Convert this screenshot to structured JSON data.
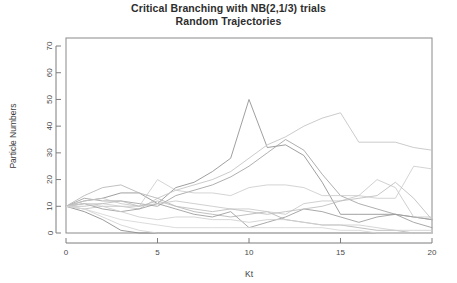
{
  "figure": {
    "width": 457,
    "height": 283,
    "background": "#ffffff"
  },
  "title": {
    "line1": "Critical Branching with NB(2,1/3) trials",
    "line2": "Random Trajectories"
  },
  "axes": {
    "x_title": "Kt",
    "y_title": "Particle Numbers",
    "x_ticks": [
      "0",
      "5",
      "10",
      "15",
      "20"
    ],
    "y_ticks": [
      "0",
      "10",
      "20",
      "30",
      "40",
      "50",
      "60",
      "70"
    ],
    "frame_color": "#8a8a8a",
    "tick_color": "#7d7d7d"
  },
  "chart_data": {
    "type": "line",
    "xlabel": "Kt",
    "ylabel": "Particle Numbers",
    "xlim": [
      0,
      20
    ],
    "ylim": [
      0,
      73
    ],
    "x_ticks": [
      0,
      5,
      10,
      15,
      20
    ],
    "y_ticks": [
      0,
      10,
      20,
      30,
      40,
      50,
      60,
      70
    ],
    "grid": false,
    "legend": "none",
    "x": [
      0,
      1,
      2,
      3,
      4,
      5,
      6,
      7,
      8,
      9,
      10,
      11,
      12,
      13,
      14,
      15,
      16,
      17,
      18,
      19,
      20
    ],
    "series": [
      {
        "name": "trajectory-1-spike",
        "color": "#8e8e8e",
        "values": [
          10,
          12,
          13,
          15,
          15,
          11,
          17,
          19,
          23,
          28,
          50,
          32,
          33,
          29,
          19,
          7,
          7,
          7,
          7,
          6,
          5
        ]
      },
      {
        "name": "trajectory-2-late-peak",
        "color": "#c2c2c2",
        "values": [
          10,
          9,
          10,
          10,
          9,
          13,
          16,
          18,
          20,
          23,
          28,
          33,
          36,
          40,
          43,
          45,
          34,
          34,
          34,
          32,
          31
        ]
      },
      {
        "name": "trajectory-3-rise-fall",
        "color": "#a0a0a0",
        "values": [
          10,
          13,
          12,
          12,
          11,
          10,
          14,
          16,
          18,
          21,
          25,
          30,
          35,
          31,
          22,
          14,
          11,
          9,
          7,
          6,
          5
        ]
      },
      {
        "name": "trajectory-4-midband",
        "color": "#cccccc",
        "values": [
          10,
          11,
          11,
          10,
          10,
          20,
          16,
          15,
          15,
          14,
          17,
          18,
          18,
          17,
          14,
          14,
          14,
          13,
          13,
          25,
          24
        ]
      },
      {
        "name": "trajectory-5-decline",
        "color": "#b5b5b5",
        "values": [
          10,
          14,
          17,
          18,
          15,
          13,
          10,
          8,
          7,
          6,
          7,
          8,
          5,
          4,
          3,
          3,
          2,
          1,
          1,
          0,
          0
        ]
      },
      {
        "name": "trajectory-6-wavy",
        "color": "#9a9a9a",
        "values": [
          10,
          11,
          9,
          8,
          9,
          11,
          9,
          7,
          6,
          8,
          2,
          4,
          6,
          9,
          8,
          6,
          4,
          6,
          7,
          4,
          2
        ]
      },
      {
        "name": "trajectory-7-late-bump",
        "color": "#c8c8c8",
        "values": [
          10,
          12,
          13,
          11,
          10,
          11,
          12,
          11,
          10,
          9,
          9,
          8,
          7,
          11,
          12,
          12,
          14,
          20,
          17,
          6,
          6
        ]
      },
      {
        "name": "trajectory-8-bump-18",
        "color": "#bdbdbd",
        "values": [
          10,
          10,
          11,
          12,
          10,
          12,
          10,
          9,
          8,
          9,
          8,
          7,
          8,
          9,
          10,
          12,
          13,
          14,
          19,
          13,
          5
        ]
      },
      {
        "name": "trajectory-9-extinct-early",
        "color": "#8a8a8a",
        "values": [
          10,
          8,
          5,
          1,
          0,
          0,
          0,
          0,
          0,
          0,
          0,
          0,
          0,
          0,
          0,
          0,
          0,
          0,
          0,
          0,
          0
        ]
      },
      {
        "name": "trajectory-10-extinct-mid",
        "color": "#d2d2d2",
        "values": [
          10,
          9,
          6,
          3,
          1,
          0,
          0,
          0,
          0,
          0,
          0,
          0,
          0,
          0,
          0,
          0,
          0,
          0,
          0,
          0,
          0
        ]
      },
      {
        "name": "trajectory-11-low-fade",
        "color": "#d6d6d6",
        "values": [
          10,
          9,
          7,
          5,
          4,
          3,
          2,
          2,
          2,
          2,
          2,
          2,
          2,
          2,
          2,
          1,
          1,
          0,
          0,
          0,
          0
        ]
      },
      {
        "name": "trajectory-12-low-tail",
        "color": "#cfcfcf",
        "values": [
          10,
          11,
          10,
          8,
          6,
          5,
          6,
          6,
          5,
          5,
          4,
          5,
          5,
          4,
          3,
          3,
          3,
          2,
          1,
          1,
          1
        ]
      }
    ]
  }
}
